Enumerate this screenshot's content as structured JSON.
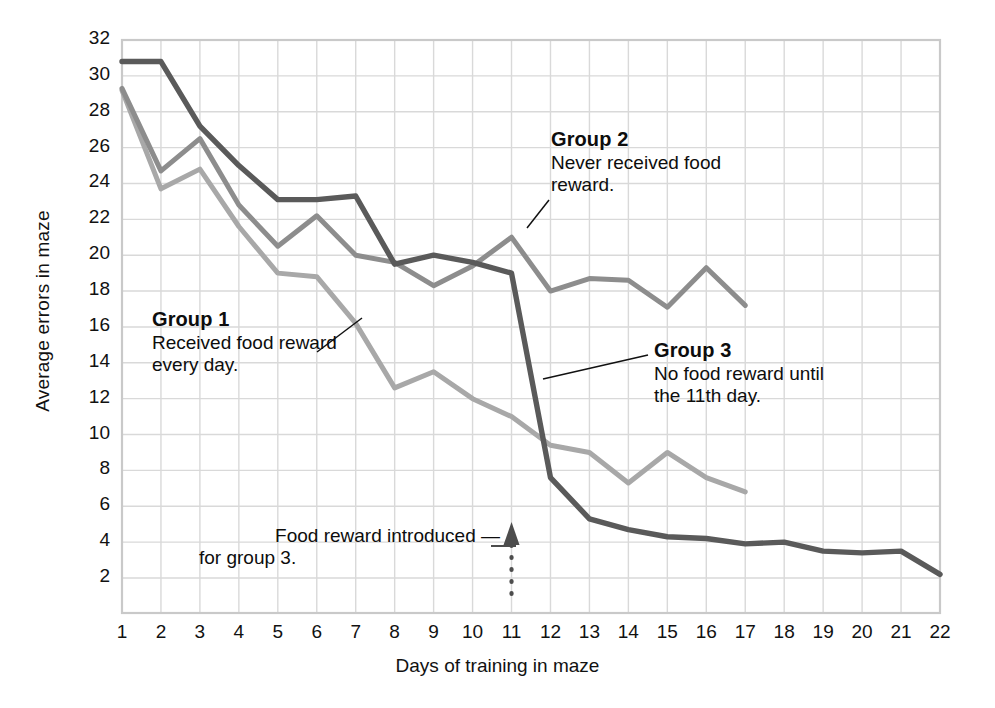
{
  "chart_data": {
    "type": "line",
    "title": "",
    "xlabel": "Days of training in maze",
    "ylabel": "Average errors in maze",
    "xlim": [
      1,
      22
    ],
    "ylim": [
      0,
      32
    ],
    "xticks": [
      1,
      2,
      3,
      4,
      5,
      6,
      7,
      8,
      9,
      10,
      11,
      12,
      13,
      14,
      15,
      16,
      17,
      18,
      19,
      20,
      21,
      22
    ],
    "yticks": [
      2,
      4,
      6,
      8,
      10,
      12,
      14,
      16,
      18,
      20,
      22,
      24,
      26,
      28,
      30,
      32
    ],
    "grid": true,
    "legend_position": "annotations-inline",
    "x": [
      1,
      2,
      3,
      4,
      5,
      6,
      7,
      8,
      9,
      10,
      11,
      12,
      13,
      14,
      15,
      16,
      17,
      18,
      19,
      20,
      21,
      22
    ],
    "series": [
      {
        "name": "Group 1",
        "color": "#a8a8a8",
        "x": [
          1,
          2,
          3,
          4,
          5,
          6,
          7,
          8,
          9,
          10,
          11,
          12,
          13,
          14,
          15,
          16,
          17
        ],
        "values": [
          29.2,
          23.7,
          24.8,
          21.6,
          19.0,
          18.8,
          16.2,
          12.6,
          13.5,
          12.0,
          11.0,
          9.4,
          9.0,
          7.3,
          9.0,
          7.6,
          6.8
        ]
      },
      {
        "name": "Group 2",
        "color": "#8d8d8d",
        "x": [
          1,
          2,
          3,
          4,
          5,
          6,
          7,
          8,
          9,
          10,
          11,
          12,
          13,
          14,
          15,
          16,
          17
        ],
        "values": [
          29.3,
          24.7,
          26.5,
          22.8,
          20.5,
          22.2,
          20.0,
          19.6,
          18.3,
          19.4,
          21.0,
          18.0,
          18.7,
          18.6,
          17.1,
          19.3,
          17.2
        ]
      },
      {
        "name": "Group 3",
        "color": "#5a5a5a",
        "x": [
          1,
          2,
          3,
          4,
          5,
          6,
          7,
          8,
          9,
          10,
          11,
          12,
          13,
          14,
          15,
          16,
          17,
          18,
          19,
          20,
          21,
          22
        ],
        "values": [
          30.8,
          30.8,
          27.2,
          25.0,
          23.1,
          23.1,
          23.3,
          19.5,
          20.0,
          19.6,
          19.0,
          7.6,
          5.3,
          4.7,
          4.3,
          4.2,
          3.9,
          4.0,
          3.5,
          3.4,
          3.5,
          2.2
        ]
      }
    ],
    "annotations": [
      {
        "id": "group-1",
        "title": "Group 1",
        "lines": [
          "Received food reward",
          "every day."
        ]
      },
      {
        "id": "group-2",
        "title": "Group 2",
        "lines": [
          "Never received food",
          "reward."
        ]
      },
      {
        "id": "group-3",
        "title": "Group 3",
        "lines": [
          "No food reward until",
          "the 11th day."
        ]
      },
      {
        "id": "food-reward-marker",
        "title": "",
        "lines": [
          "Food reward introduced —",
          "for group 3."
        ],
        "marker_day": 11
      }
    ]
  },
  "colors": {
    "group1": "#a8a8a8",
    "group2": "#8d8d8d",
    "group3": "#5a5a5a",
    "grid": "#d9d9d9",
    "axis": "#c9c9c9",
    "text": "#111111",
    "marker": "#4d4d4d",
    "background": "#ffffff"
  }
}
